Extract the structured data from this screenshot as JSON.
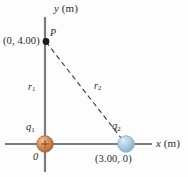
{
  "figure": {
    "type": "physics-diagram",
    "background_color": "#fdfdfd",
    "axis_color": "#7c7c7c",
    "dash_color": "#3a3a3a",
    "text_color": "#2a2a2a"
  },
  "axes": {
    "y_label": "y",
    "y_unit": "(m)",
    "x_label": "x",
    "x_unit": "(m)",
    "origin_label": "0"
  },
  "points": {
    "p": {
      "name": "P",
      "coordinate_label": "(0, 4.00)",
      "marker_color": "#1a1a1a",
      "x": 0,
      "y": 4.0
    }
  },
  "charges": [
    {
      "symbol": "q",
      "subscript": "1",
      "sign": "+",
      "color": "#d08a5a",
      "edge_color": "#a35f2e",
      "coordinate_label": "0",
      "x": 0,
      "y": 0
    },
    {
      "symbol": "q",
      "subscript": "2",
      "sign": "",
      "color": "#a8c6dd",
      "edge_color": "#7ba4c4",
      "coordinate_label": "(3.00, 0)",
      "x": 3.0,
      "y": 0
    }
  ],
  "distances": [
    {
      "symbol": "r",
      "subscript": "1",
      "style": "solid",
      "from": "q1",
      "to": "P"
    },
    {
      "symbol": "r",
      "subscript": "2",
      "style": "dashed",
      "from": "q2",
      "to": "P"
    }
  ]
}
